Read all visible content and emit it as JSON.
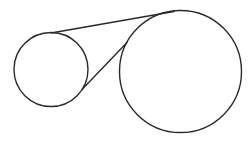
{
  "diagram": {
    "type": "two-circles-with-tangents",
    "canvas": {
      "width": 252,
      "height": 142,
      "background": "#ffffff"
    },
    "stroke_color": "#2a2a2a",
    "stroke_width": 1.4,
    "circles": [
      {
        "name": "small-circle",
        "cx": 51,
        "cy": 69.5,
        "r": 37
      },
      {
        "name": "large-circle",
        "cx": 180.5,
        "cy": 71.5,
        "r": 61
      }
    ],
    "tangents": [
      {
        "name": "external-tangent",
        "x1": 51,
        "y1": 33,
        "x2": 174,
        "y2": 11.5
      },
      {
        "name": "internal-tangent",
        "x1": 82,
        "y1": 89.5,
        "x2": 127,
        "y2": 42.5
      }
    ]
  }
}
